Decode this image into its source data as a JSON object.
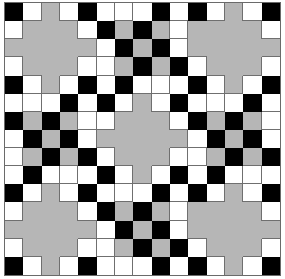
{
  "figure": {
    "name": "quilt-block-pattern",
    "width_px": 285,
    "height_px": 279,
    "border_color": "#6a6a6a"
  },
  "palette": {
    "k": "#000000",
    "w": "#ffffff",
    "g": "#b6b6b6",
    "seam": "#6f6f6f"
  },
  "legend": {
    "k_label": "black patch",
    "w_label": "white patch",
    "g_label": "gray patch"
  },
  "chart_data": {
    "type": "heatmap",
    "xlabel": "",
    "ylabel": "",
    "columns": 15,
    "rows": 15,
    "value_colors": {
      "k": "#000000",
      "w": "#ffffff",
      "g": "#b6b6b6"
    },
    "categories": [
      "c1",
      "c2",
      "c3",
      "c4",
      "c5",
      "c6",
      "c7",
      "c8",
      "c9",
      "c10",
      "c11",
      "c12",
      "c13",
      "c14",
      "c15"
    ],
    "grid": [
      [
        "k",
        "w",
        "g",
        "w",
        "k",
        "w",
        "w",
        "w",
        "k",
        "w",
        "k",
        "w",
        "g",
        "w",
        "k"
      ],
      [
        "w",
        "g",
        "g",
        "g",
        "w",
        "k",
        "g",
        "k",
        "g",
        "w",
        "g",
        "g",
        "g",
        "g",
        "w"
      ],
      [
        "g",
        "g",
        "g",
        "g",
        "g",
        "w",
        "k",
        "g",
        "k",
        "w",
        "g",
        "g",
        "g",
        "g",
        "g"
      ],
      [
        "w",
        "g",
        "g",
        "g",
        "w",
        "w",
        "g",
        "k",
        "g",
        "k",
        "w",
        "g",
        "g",
        "g",
        "w"
      ],
      [
        "k",
        "w",
        "g",
        "w",
        "k",
        "w",
        "k",
        "w",
        "w",
        "w",
        "k",
        "w",
        "g",
        "w",
        "k"
      ],
      [
        "w",
        "w",
        "w",
        "k",
        "w",
        "k",
        "w",
        "g",
        "w",
        "k",
        "w",
        "w",
        "w",
        "k",
        "w"
      ],
      [
        "k",
        "g",
        "k",
        "g",
        "w",
        "w",
        "g",
        "g",
        "g",
        "w",
        "k",
        "g",
        "k",
        "g",
        "w"
      ],
      [
        "w",
        "k",
        "g",
        "k",
        "w",
        "g",
        "g",
        "g",
        "g",
        "g",
        "w",
        "k",
        "g",
        "k",
        "w"
      ],
      [
        "w",
        "g",
        "k",
        "g",
        "k",
        "w",
        "g",
        "g",
        "g",
        "w",
        "w",
        "g",
        "k",
        "g",
        "k"
      ],
      [
        "w",
        "k",
        "w",
        "w",
        "w",
        "k",
        "w",
        "g",
        "w",
        "k",
        "w",
        "k",
        "w",
        "w",
        "w"
      ],
      [
        "k",
        "w",
        "g",
        "w",
        "k",
        "w",
        "w",
        "w",
        "k",
        "w",
        "k",
        "w",
        "g",
        "w",
        "k"
      ],
      [
        "w",
        "g",
        "g",
        "g",
        "w",
        "k",
        "g",
        "k",
        "g",
        "w",
        "g",
        "g",
        "g",
        "g",
        "w"
      ],
      [
        "g",
        "g",
        "g",
        "g",
        "g",
        "w",
        "k",
        "g",
        "k",
        "w",
        "g",
        "g",
        "g",
        "g",
        "g"
      ],
      [
        "w",
        "g",
        "g",
        "g",
        "w",
        "w",
        "g",
        "k",
        "g",
        "k",
        "w",
        "g",
        "g",
        "g",
        "w"
      ],
      [
        "k",
        "w",
        "g",
        "w",
        "k",
        "w",
        "w",
        "w",
        "k",
        "w",
        "k",
        "w",
        "g",
        "w",
        "k"
      ]
    ]
  }
}
